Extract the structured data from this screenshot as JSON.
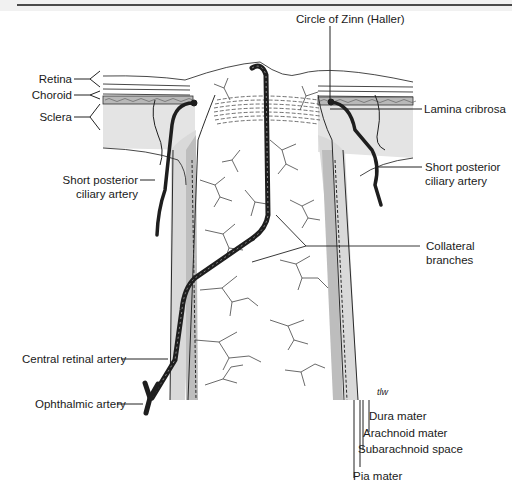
{
  "figure": {
    "colors": {
      "sclera_fill": "#e4e4e4",
      "sheath_fill": "#d9d9d9",
      "vessel": "#1e1e1e",
      "line": "#2a2a2a",
      "top_band": "#f1f1f1"
    }
  },
  "labels": {
    "circle_of_zinn": "Circle of Zinn (Haller)",
    "retina": "Retina",
    "choroid": "Choroid",
    "sclera": "Sclera",
    "lamina_cribrosa": "Lamina cribrosa",
    "short_posterior_ciliary_left_1": "Short posterior",
    "short_posterior_ciliary_left_2": "ciliary artery",
    "short_posterior_ciliary_right_1": "Short posterior",
    "short_posterior_ciliary_right_2": "ciliary artery",
    "collateral_1": "Collateral",
    "collateral_2": "branches",
    "central_retinal_artery": "Central retinal artery",
    "ophthalmic_artery": "Ophthalmic artery",
    "dura_mater": "Dura mater",
    "arachnoid_mater": "Arachnoid mater",
    "subarachnoid_space": "Subarachnoid space",
    "pia_mater": "Pia mater",
    "signature": "tlw"
  }
}
